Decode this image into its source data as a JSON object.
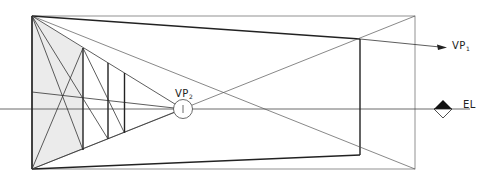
{
  "diagram": {
    "type": "two-point perspective construction",
    "labels": {
      "vp1": "VP",
      "vp1_sub": "1",
      "vp2": "VP",
      "vp2_sub": "2",
      "eye_level": "EL"
    },
    "colors": {
      "line": "#2a2a2a",
      "thin_line": "#555555",
      "shade": "#ebebeb",
      "background": "#ffffff"
    }
  }
}
